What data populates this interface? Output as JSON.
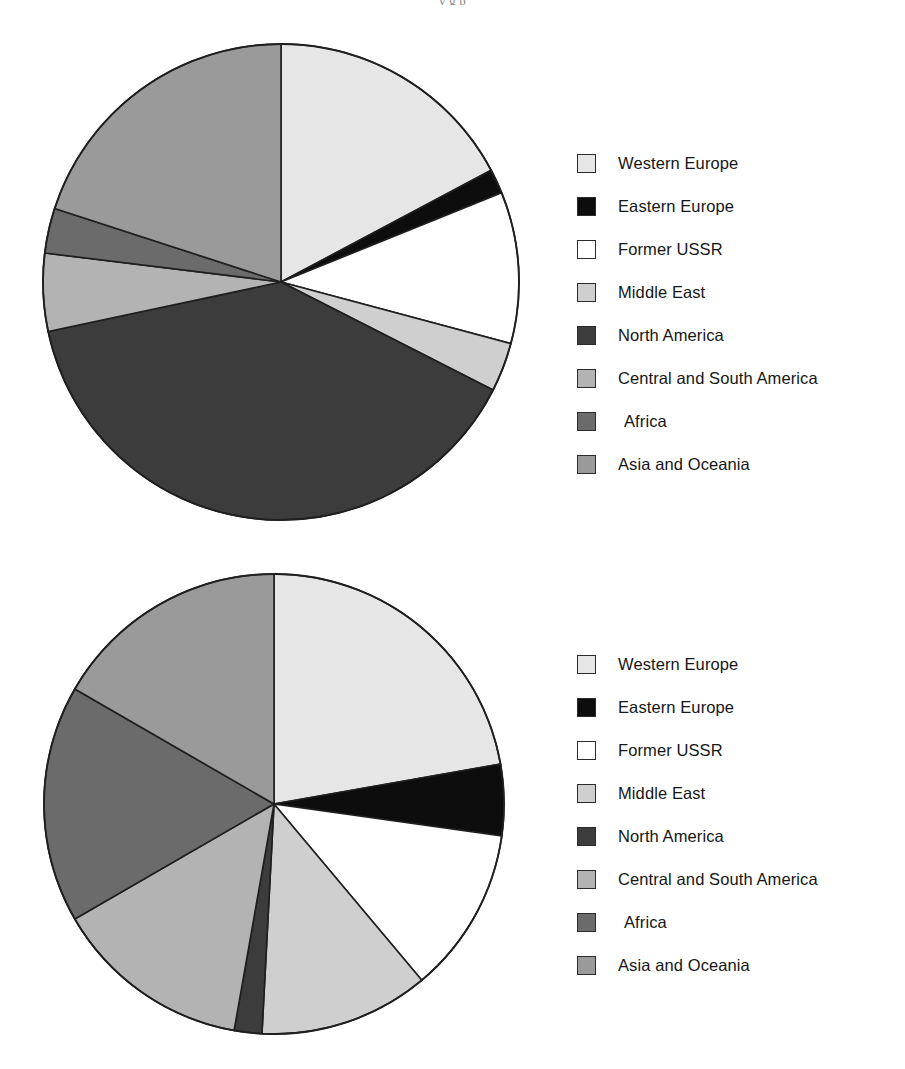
{
  "page": {
    "running_head": "y                 g                   p",
    "background_color": "#ffffff"
  },
  "palette": {
    "western_europe": "#e6e6e6",
    "eastern_europe": "#0d0d0d",
    "former_ussr": "#ffffff",
    "middle_east": "#cfcfcf",
    "north_america": "#3c3c3c",
    "central_south_america": "#b3b3b3",
    "africa": "#6b6b6b",
    "asia_oceania": "#9a9a9a",
    "outline": "#1f1f1f"
  },
  "legend_top": {
    "items": [
      {
        "label": "Western Europe",
        "color": "#e6e6e6"
      },
      {
        "label": "Eastern Europe",
        "color": "#0d0d0d"
      },
      {
        "label": "Former USSR",
        "color": "#ffffff"
      },
      {
        "label": "Middle East",
        "color": "#cfcfcf"
      },
      {
        "label": "North America",
        "color": "#3c3c3c"
      },
      {
        "label": "Central and South America",
        "color": "#b3b3b3"
      },
      {
        "label": "Africa",
        "color": "#6b6b6b"
      },
      {
        "label": "Asia and Oceania",
        "color": "#9a9a9a"
      }
    ]
  },
  "legend_bottom": {
    "items": [
      {
        "label": "Western Europe",
        "color": "#e6e6e6"
      },
      {
        "label": "Eastern Europe",
        "color": "#0d0d0d"
      },
      {
        "label": "Former USSR",
        "color": "#ffffff"
      },
      {
        "label": "Middle East",
        "color": "#cfcfcf"
      },
      {
        "label": "North America",
        "color": "#3c3c3c"
      },
      {
        "label": "Central and South America",
        "color": "#b3b3b3"
      },
      {
        "label": "Africa",
        "color": "#6b6b6b"
      },
      {
        "label": "Asia and Oceania",
        "color": "#9a9a9a"
      }
    ]
  },
  "chart_data": [
    {
      "type": "pie",
      "title": "",
      "position": "top",
      "start_angle_deg": 0,
      "direction": "clockwise",
      "center_px": [
        280,
        281
      ],
      "radius_px": 238,
      "labels": [
        "Western Europe",
        "Eastern Europe",
        "Former USSR",
        "Middle East",
        "North America",
        "Central and South America",
        "Africa",
        "Asia and Oceania"
      ],
      "values": [
        17.2,
        1.7,
        10.3,
        3.3,
        39.2,
        5.3,
        3.1,
        19.9
      ],
      "angles_deg": [
        62.0,
        6.0,
        37.0,
        12.0,
        141.0,
        19.0,
        11.0,
        72.0
      ],
      "colors": [
        "#e6e6e6",
        "#0d0d0d",
        "#ffffff",
        "#cfcfcf",
        "#3c3c3c",
        "#b3b3b3",
        "#6b6b6b",
        "#9a9a9a"
      ],
      "legend_position": "right"
    },
    {
      "type": "pie",
      "title": "",
      "position": "bottom",
      "start_angle_deg": 0,
      "direction": "clockwise",
      "center_px": [
        273,
        803
      ],
      "radius_px": 230,
      "labels": [
        "Western Europe",
        "Eastern Europe",
        "Former USSR",
        "Middle East",
        "North America",
        "Central and South America",
        "Africa",
        "Asia and Oceania"
      ],
      "values": [
        22.2,
        5.0,
        11.7,
        11.9,
        1.9,
        13.9,
        16.7,
        16.7
      ],
      "angles_deg": [
        80.0,
        18.0,
        42.0,
        43.0,
        7.0,
        50.0,
        60.0,
        60.0
      ],
      "colors": [
        "#e6e6e6",
        "#0d0d0d",
        "#ffffff",
        "#cfcfcf",
        "#3c3c3c",
        "#b3b3b3",
        "#6b6b6b",
        "#9a9a9a"
      ],
      "legend_position": "right"
    }
  ]
}
